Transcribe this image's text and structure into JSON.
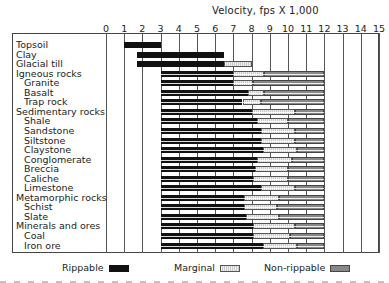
{
  "chart_data": {
    "type": "bar",
    "orientation": "horizontal-stacked-range",
    "title": "Velocity, fps X 1,000",
    "xlabel": "Velocity, fps X 1,000",
    "ylabel": "",
    "xlim": [
      0,
      15
    ],
    "x_ticks": [
      "0",
      "1",
      "2",
      "3",
      "4",
      "5",
      "6",
      "7",
      "8",
      "9",
      "10",
      "11",
      "12",
      "13",
      "14",
      "15"
    ],
    "grid": true,
    "legend": {
      "position": "bottom",
      "entries": [
        {
          "name": "Rippable",
          "color": "#111111"
        },
        {
          "name": "Marginal",
          "color": "#dddddd"
        },
        {
          "name": "Non-rippable",
          "color": "#888888"
        }
      ]
    },
    "categories": [
      "Topsoil",
      "Clay",
      "Glacial till",
      "Igneous rocks",
      "Granite",
      "Basalt",
      "Trap rock",
      "Sedimentary rocks",
      "Shale",
      "Sandstone",
      "Siltstone",
      "Claystone",
      "Conglomerate",
      "Breccia",
      "Caliche",
      "Limestone",
      "Metamorphic rocks",
      "Schist",
      "Slate",
      "Minerals and ores",
      "Coal",
      "Iron ore"
    ],
    "rows": [
      {
        "label": "Topsoil",
        "indent": 0,
        "rippable": [
          1.0,
          3.0
        ],
        "marginal": null,
        "non_rippable": null
      },
      {
        "label": "Clay",
        "indent": 0,
        "rippable": [
          1.7,
          6.5
        ],
        "marginal": null,
        "non_rippable": null
      },
      {
        "label": "Glacial till",
        "indent": 0,
        "rippable": [
          1.7,
          6.5
        ],
        "marginal": [
          6.5,
          8.0
        ],
        "non_rippable": null
      },
      {
        "label": "Igneous rocks",
        "indent": 0,
        "rippable": [
          3.0,
          7.0
        ],
        "marginal": [
          7.0,
          8.7
        ],
        "non_rippable": [
          8.7,
          12.0
        ]
      },
      {
        "label": "Granite",
        "indent": 1,
        "rippable": [
          3.0,
          7.0
        ],
        "marginal": [
          7.0,
          8.1
        ],
        "non_rippable": [
          8.1,
          12.0
        ]
      },
      {
        "label": "Basalt",
        "indent": 1,
        "rippable": [
          3.0,
          7.8
        ],
        "marginal": [
          7.8,
          8.7
        ],
        "non_rippable": [
          8.7,
          12.0
        ]
      },
      {
        "label": "Trap rock",
        "indent": 1,
        "rippable": [
          3.0,
          7.5
        ],
        "marginal": [
          7.5,
          8.5
        ],
        "non_rippable": [
          8.5,
          12.0
        ]
      },
      {
        "label": "Sedimentary rocks",
        "indent": 0,
        "rippable": [
          3.0,
          8.0
        ],
        "marginal": [
          8.0,
          10.4
        ],
        "non_rippable": [
          10.4,
          12.0
        ]
      },
      {
        "label": "Shale",
        "indent": 1,
        "rippable": [
          3.0,
          8.3
        ],
        "marginal": [
          8.3,
          10.0
        ],
        "non_rippable": [
          10.0,
          12.0
        ]
      },
      {
        "label": "Sandstone",
        "indent": 1,
        "rippable": [
          3.0,
          8.5
        ],
        "marginal": [
          8.5,
          10.4
        ],
        "non_rippable": [
          10.4,
          12.0
        ]
      },
      {
        "label": "Siltstone",
        "indent": 1,
        "rippable": [
          3.0,
          8.5
        ],
        "marginal": [
          8.5,
          10.4
        ],
        "non_rippable": [
          10.4,
          12.0
        ]
      },
      {
        "label": "Claystone",
        "indent": 1,
        "rippable": [
          3.0,
          8.6
        ],
        "marginal": [
          8.6,
          10.5
        ],
        "non_rippable": [
          10.5,
          12.0
        ]
      },
      {
        "label": "Conglomerate",
        "indent": 1,
        "rippable": [
          3.0,
          8.3
        ],
        "marginal": [
          8.3,
          10.2
        ],
        "non_rippable": [
          10.2,
          12.0
        ]
      },
      {
        "label": "Breccia",
        "indent": 1,
        "rippable": [
          3.0,
          8.2
        ],
        "marginal": [
          8.2,
          10.0
        ],
        "non_rippable": [
          10.0,
          12.0
        ]
      },
      {
        "label": "Caliche",
        "indent": 1,
        "rippable": [
          3.0,
          8.1
        ],
        "marginal": [
          8.1,
          10.0
        ],
        "non_rippable": [
          10.0,
          12.0
        ]
      },
      {
        "label": "Limestone",
        "indent": 1,
        "rippable": [
          3.0,
          8.5
        ],
        "marginal": [
          8.5,
          10.4
        ],
        "non_rippable": [
          10.4,
          12.0
        ]
      },
      {
        "label": "Metamorphic rocks",
        "indent": 0,
        "rippable": [
          3.0,
          7.6
        ],
        "marginal": [
          7.6,
          9.5
        ],
        "non_rippable": [
          9.5,
          12.0
        ]
      },
      {
        "label": "Schist",
        "indent": 1,
        "rippable": [
          3.0,
          7.6
        ],
        "marginal": [
          7.6,
          9.4
        ],
        "non_rippable": [
          9.4,
          12.0
        ]
      },
      {
        "label": "Slate",
        "indent": 1,
        "rippable": [
          3.0,
          7.7
        ],
        "marginal": [
          7.7,
          9.5
        ],
        "non_rippable": [
          9.5,
          12.0
        ]
      },
      {
        "label": "Minerals and ores",
        "indent": 0,
        "rippable": [
          3.0,
          8.1
        ],
        "marginal": [
          8.1,
          10.4
        ],
        "non_rippable": [
          10.4,
          12.0
        ]
      },
      {
        "label": "Coal",
        "indent": 1,
        "rippable": [
          3.0,
          8.1
        ],
        "marginal": [
          8.1,
          10.1
        ],
        "non_rippable": [
          10.1,
          12.0
        ]
      },
      {
        "label": "Iron ore",
        "indent": 1,
        "rippable": [
          3.0,
          8.6
        ],
        "marginal": [
          8.6,
          10.5
        ],
        "non_rippable": [
          10.5,
          12.0
        ]
      }
    ]
  }
}
